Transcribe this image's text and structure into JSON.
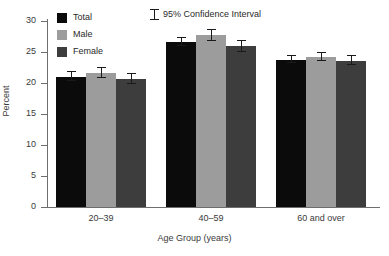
{
  "chart_data": {
    "type": "bar",
    "title": "",
    "subtitle": "",
    "xlabel": "Age Group (years)",
    "ylabel": "Percent",
    "categories": [
      "20–39",
      "40–59",
      "60 and over"
    ],
    "series": [
      {
        "name": "Total",
        "color": "#0b0b0b",
        "values": [
          21.0,
          26.6,
          23.7
        ],
        "ci_low": [
          20.4,
          25.9,
          23.2
        ],
        "ci_high": [
          21.7,
          27.3,
          24.3
        ]
      },
      {
        "name": "Male",
        "color": "#9c9c9c",
        "values": [
          21.6,
          27.7,
          24.2
        ],
        "ci_low": [
          20.8,
          26.7,
          23.5
        ],
        "ci_high": [
          22.5,
          28.6,
          24.9
        ]
      },
      {
        "name": "Female",
        "color": "#3d3d3d",
        "values": [
          20.6,
          25.9,
          23.6
        ],
        "ci_low": [
          19.8,
          25.0,
          22.9
        ],
        "ci_high": [
          21.4,
          26.8,
          24.3
        ]
      }
    ],
    "ylim": [
      0,
      30
    ],
    "yticks": [
      0,
      5,
      10,
      15,
      20,
      25,
      30
    ],
    "ytick_labels": [
      "0",
      "5",
      "10",
      "15",
      "20",
      "25",
      "30"
    ],
    "grid": false,
    "legend_position": "top-left",
    "annotations": [
      "95% Confidence Interval"
    ],
    "error_bars": "95% Confidence Interval"
  },
  "legend": {
    "entries": [
      {
        "label": "Total"
      },
      {
        "label": "Male"
      },
      {
        "label": "Female"
      }
    ],
    "ci_label": "95% Confidence Interval"
  },
  "axes": {
    "y_title": "Percent",
    "x_title": "Age Group (years)"
  }
}
